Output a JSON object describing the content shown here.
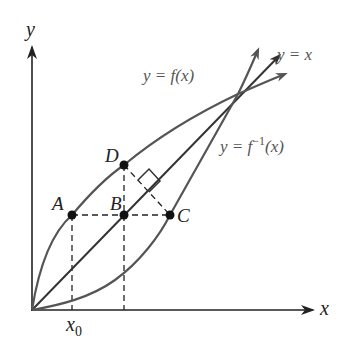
{
  "diagram": {
    "type": "inverse-function-reflection",
    "axes": {
      "x_label": "x",
      "y_label": "y",
      "x_tick_label": "x",
      "x_tick_subscript": "0"
    },
    "curves": {
      "f": {
        "label": "y = f(x)",
        "color": "#555555"
      },
      "f_inverse": {
        "label_prefix": "y = f",
        "label_exponent": "−1",
        "label_suffix": "(x)",
        "color": "#555555"
      },
      "identity": {
        "label": "y = x",
        "color": "#333333"
      }
    },
    "points": [
      {
        "name": "A",
        "label": "A",
        "on": "y = f(x)"
      },
      {
        "name": "B",
        "label": "B",
        "on": "y = x"
      },
      {
        "name": "C",
        "label": "C",
        "on": "y = f^-1(x)"
      },
      {
        "name": "D",
        "label": "D",
        "on": "y = f(x)"
      }
    ],
    "annotations": {
      "right_angle": "DC ⟂ y = x",
      "dashed_segments": [
        "A–B–C horizontal",
        "D–B vertical",
        "D–C",
        "A to x0 vertical",
        "B to x-axis vertical"
      ]
    }
  }
}
